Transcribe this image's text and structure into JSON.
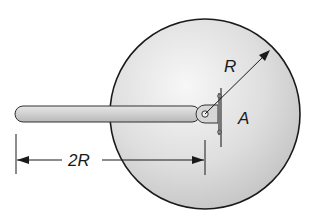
{
  "diagram": {
    "type": "mechanics-figure",
    "labels": {
      "radius": "R",
      "pivot": "A",
      "rod_length": "2R"
    },
    "colors": {
      "disk_fill_light": "#f2f2f2",
      "disk_fill_dark": "#c9c9c9",
      "outline": "#1a1a1a",
      "rod_fill": "#d4d4d4",
      "background": "#ffffff"
    }
  }
}
